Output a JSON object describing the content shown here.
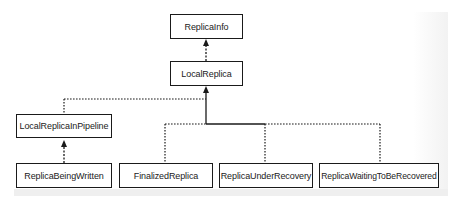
{
  "diagram": {
    "type": "class-hierarchy",
    "nodes": {
      "replica_info": "ReplicaInfo",
      "local_replica": "LocalReplica",
      "local_replica_in_pipeline": "LocalReplicaInPipeline",
      "replica_being_written": "ReplicaBeingWritten",
      "finalized_replica": "FinalizedReplica",
      "replica_under_recovery": "ReplicaUnderRecovery",
      "replica_waiting_to_be_recovered": "ReplicaWaitingToBeRecovered"
    },
    "edges": [
      {
        "from": "LocalReplica",
        "to": "ReplicaInfo",
        "style": "dashed",
        "arrow": "filled"
      },
      {
        "from": "LocalReplicaInPipeline",
        "to": "LocalReplica",
        "style": "dashed",
        "arrow": "filled"
      },
      {
        "from": "FinalizedReplica",
        "to": "LocalReplica",
        "style": "dashed",
        "arrow": "filled"
      },
      {
        "from": "ReplicaUnderRecovery",
        "to": "LocalReplica",
        "style": "dashed",
        "arrow": "filled"
      },
      {
        "from": "ReplicaWaitingToBeRecovered",
        "to": "LocalReplica",
        "style": "dashed",
        "arrow": "filled"
      },
      {
        "from": "ReplicaBeingWritten",
        "to": "LocalReplicaInPipeline",
        "style": "dashed",
        "arrow": "filled"
      }
    ],
    "colors": {
      "line": "#1a1a1a",
      "box_border": "#1a1a1a",
      "box_fill": "#ffffff",
      "text": "#222222",
      "background": "#ffffff"
    }
  }
}
